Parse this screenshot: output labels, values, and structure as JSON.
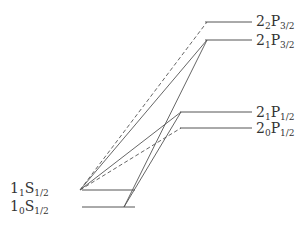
{
  "diagram": {
    "type": "energy-level-diagram",
    "line_color": "#555555",
    "levels": [
      {
        "id": "2_2P_3_2",
        "n": "2",
        "sub": "2",
        "term": "P",
        "j": "3/2",
        "x1": 205,
        "x2": 252,
        "y": 22,
        "label_x": 256,
        "label_y": 14
      },
      {
        "id": "2_1P_3_2",
        "n": "2",
        "sub": "1",
        "term": "P",
        "j": "3/2",
        "x1": 205,
        "x2": 252,
        "y": 40,
        "label_x": 256,
        "label_y": 33
      },
      {
        "id": "2_1P_1_2",
        "n": "2",
        "sub": "1",
        "term": "P",
        "j": "1/2",
        "x1": 180,
        "x2": 252,
        "y": 112,
        "label_x": 256,
        "label_y": 105
      },
      {
        "id": "2_0P_1_2",
        "n": "2",
        "sub": "0",
        "term": "P",
        "j": "1/2",
        "x1": 180,
        "x2": 252,
        "y": 128,
        "label_x": 256,
        "label_y": 121
      },
      {
        "id": "1_1S_1_2",
        "n": "1",
        "sub": "1",
        "term": "S",
        "j": "1/2",
        "x1": 82,
        "x2": 135,
        "y": 190,
        "label_x": 10,
        "label_y": 181
      },
      {
        "id": "1_0S_1_2",
        "n": "1",
        "sub": "0",
        "term": "S",
        "j": "1/2",
        "x1": 82,
        "x2": 135,
        "y": 207,
        "label_x": 10,
        "label_y": 199
      }
    ],
    "transitions": [
      {
        "from": "1_1S_1_2",
        "to": "2_2P_3_2",
        "style": "dashed",
        "x1": 80,
        "y1": 190,
        "x2": 207,
        "y2": 22
      },
      {
        "from": "1_1S_1_2",
        "to": "2_1P_3_2",
        "style": "solid",
        "x1": 80,
        "y1": 190,
        "x2": 207,
        "y2": 40
      },
      {
        "from": "1_0S_1_2",
        "to": "2_1P_3_2",
        "style": "solid",
        "x1": 124,
        "y1": 207,
        "x2": 207,
        "y2": 40
      },
      {
        "from": "1_1S_1_2",
        "to": "2_1P_1_2",
        "style": "solid",
        "x1": 80,
        "y1": 190,
        "x2": 181,
        "y2": 112
      },
      {
        "from": "1_1S_1_2",
        "to": "2_0P_1_2",
        "style": "dashed",
        "x1": 80,
        "y1": 190,
        "x2": 181,
        "y2": 128
      },
      {
        "from": "1_0S_1_2",
        "to": "2_1P_1_2",
        "style": "solid",
        "x1": 124,
        "y1": 207,
        "x2": 181,
        "y2": 112
      }
    ]
  }
}
